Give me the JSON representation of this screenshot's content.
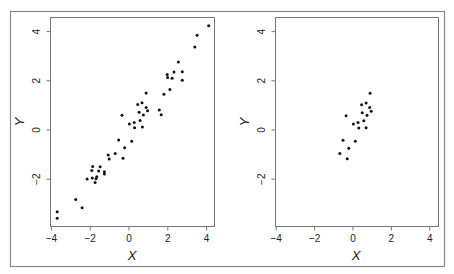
{
  "figure": {
    "border_color": "#8a8a8a",
    "frame_color": "#777777",
    "point_color": "#111111"
  },
  "chart_data": [
    {
      "type": "scatter",
      "title": "",
      "xlabel": "X",
      "ylabel": "Y",
      "xlim": [
        -4.1,
        4.4
      ],
      "ylim": [
        -3.9,
        4.5
      ],
      "xticks": [
        -4,
        -2,
        0,
        2,
        4
      ],
      "xtick_labels": [
        "−4",
        "−2",
        "0",
        "2",
        "4"
      ],
      "yticks": [
        -2,
        0,
        2,
        4
      ],
      "ytick_labels": [
        "−2",
        "0",
        "2",
        "4"
      ],
      "grid": false,
      "legend": null,
      "points": [
        [
          4.11,
          4.24
        ],
        [
          3.51,
          3.85
        ],
        [
          3.39,
          3.37
        ],
        [
          2.54,
          2.76
        ],
        [
          2.32,
          2.36
        ],
        [
          2.75,
          2.37
        ],
        [
          1.97,
          2.26
        ],
        [
          1.99,
          2.14
        ],
        [
          2.22,
          2.1
        ],
        [
          2.75,
          2.02
        ],
        [
          2.11,
          1.65
        ],
        [
          1.8,
          1.45
        ],
        [
          0.88,
          1.51
        ],
        [
          0.67,
          1.11
        ],
        [
          0.45,
          1.04
        ],
        [
          0.88,
          0.92
        ],
        [
          0.96,
          0.78
        ],
        [
          0.52,
          0.72
        ],
        [
          1.56,
          0.81
        ],
        [
          1.66,
          0.62
        ],
        [
          0.74,
          0.61
        ],
        [
          -0.36,
          0.6
        ],
        [
          0.57,
          0.39
        ],
        [
          0.27,
          0.3
        ],
        [
          0.02,
          0.24
        ],
        [
          0.29,
          0.09
        ],
        [
          0.69,
          0.12
        ],
        [
          -0.53,
          -0.41
        ],
        [
          0.14,
          -0.46
        ],
        [
          -0.22,
          -0.72
        ],
        [
          -0.71,
          -0.95
        ],
        [
          -1.07,
          -1.02
        ],
        [
          -1.02,
          -1.18
        ],
        [
          -0.31,
          -1.15
        ],
        [
          -1.87,
          -1.48
        ],
        [
          -1.49,
          -1.49
        ],
        [
          -1.92,
          -1.65
        ],
        [
          -1.56,
          -1.67
        ],
        [
          -1.27,
          -1.7
        ],
        [
          -1.27,
          -1.79
        ],
        [
          -2.16,
          -1.99
        ],
        [
          -1.89,
          -1.95
        ],
        [
          -1.66,
          -1.9
        ],
        [
          -1.7,
          -1.98
        ],
        [
          -1.75,
          -2.13
        ],
        [
          -2.75,
          -2.82
        ],
        [
          -2.42,
          -3.16
        ],
        [
          -3.7,
          -3.32
        ],
        [
          -3.7,
          -3.59
        ]
      ]
    },
    {
      "type": "scatter",
      "title": "",
      "xlabel": "X",
      "ylabel": "Y",
      "xlim": [
        -4.1,
        4.4
      ],
      "ylim": [
        -3.9,
        4.5
      ],
      "xticks": [
        -4,
        -2,
        0,
        2,
        4
      ],
      "xtick_labels": [
        "−4",
        "−2",
        "0",
        "2",
        "4"
      ],
      "yticks": [
        -2,
        0,
        2,
        4
      ],
      "ytick_labels": [
        "−2",
        "0",
        "2",
        "4"
      ],
      "grid": false,
      "legend": null,
      "points": [
        [
          0.89,
          1.49
        ],
        [
          0.45,
          1.03
        ],
        [
          0.68,
          1.1
        ],
        [
          0.87,
          0.91
        ],
        [
          0.95,
          0.76
        ],
        [
          0.48,
          0.7
        ],
        [
          0.73,
          0.6
        ],
        [
          -0.36,
          0.58
        ],
        [
          0.56,
          0.38
        ],
        [
          0.26,
          0.3
        ],
        [
          0.02,
          0.24
        ],
        [
          0.3,
          0.08
        ],
        [
          0.68,
          0.09
        ],
        [
          -0.52,
          -0.42
        ],
        [
          0.12,
          -0.46
        ],
        [
          -0.22,
          -0.74
        ],
        [
          -0.69,
          -0.96
        ],
        [
          -0.3,
          -1.17
        ]
      ]
    }
  ]
}
